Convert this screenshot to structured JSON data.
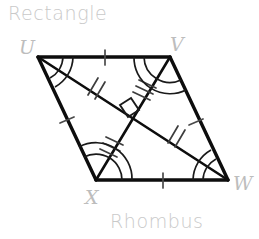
{
  "canvas": {
    "width": 259,
    "height": 239,
    "background": "#ffffff"
  },
  "captions": {
    "top": "Rectangle",
    "bottom": "Rhombus"
  },
  "colors": {
    "stroke": "#0d0d0d",
    "caption": "#c9c9c9",
    "vertex_label": "#bdbdbd"
  },
  "figure": {
    "name": "rhombus-UVWX",
    "vertices": [
      {
        "id": "U",
        "label": "U",
        "x": 38,
        "y": 57
      },
      {
        "id": "V",
        "label": "V",
        "x": 170,
        "y": 57
      },
      {
        "id": "W",
        "label": "W",
        "x": 228,
        "y": 180
      },
      {
        "id": "X",
        "label": "X",
        "x": 96,
        "y": 180
      }
    ],
    "sides": [
      {
        "from": "U",
        "to": "V",
        "ticks": 1
      },
      {
        "from": "V",
        "to": "W",
        "ticks": 1
      },
      {
        "from": "W",
        "to": "X",
        "ticks": 1
      },
      {
        "from": "X",
        "to": "U",
        "ticks": 1
      }
    ],
    "diagonals": [
      {
        "from": "U",
        "to": "W",
        "ticks_per_half": 2
      },
      {
        "from": "V",
        "to": "X",
        "ticks_per_half": 3
      }
    ],
    "right_angle_mark": {
      "at": "diagonal-intersection",
      "x": 133,
      "y": 118
    },
    "angle_marks": [
      {
        "vertex": "U",
        "arcs": 2
      },
      {
        "vertex": "V",
        "arcs": 2
      },
      {
        "vertex": "W",
        "arcs": 2
      },
      {
        "vertex": "X",
        "arcs": 2
      }
    ]
  }
}
